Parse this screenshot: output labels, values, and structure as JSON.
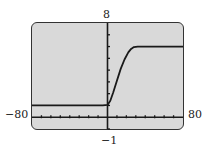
{
  "chart_data": {
    "type": "line",
    "title": "",
    "xlabel": "",
    "ylabel": "",
    "xlim": [
      -80,
      80
    ],
    "ylim": [
      -1,
      8
    ],
    "xscale": 10,
    "yscale": 1,
    "grid": false,
    "window_labels": {
      "xmin": "−80",
      "xmax": "80",
      "ymin": "−1",
      "ymax": "8"
    },
    "series": [
      {
        "name": "f(x)",
        "x": [
          -80,
          -40,
          -5,
          0,
          3,
          6,
          10,
          14,
          18,
          22,
          25,
          28,
          32,
          40,
          60,
          80
        ],
        "y": [
          1,
          1,
          1,
          1.05,
          1.4,
          2.1,
          3.1,
          4.1,
          4.9,
          5.5,
          5.8,
          5.95,
          6,
          6,
          6,
          6
        ]
      }
    ],
    "colors": {
      "screen": "#d9d9d9",
      "curve": "#1a1a1a",
      "axis": "#1a1a1a"
    }
  }
}
